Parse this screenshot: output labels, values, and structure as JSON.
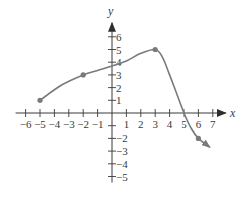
{
  "chart_data": {
    "type": "line",
    "title": "",
    "xlabel": "x",
    "ylabel": "y",
    "xlim": [
      -6,
      7
    ],
    "ylim": [
      -5,
      6
    ],
    "grid": false,
    "x_ticks": [
      -6,
      -5,
      -4,
      -3,
      -2,
      -1,
      1,
      2,
      3,
      4,
      5,
      6,
      7
    ],
    "x_tick_labels": [
      "−6",
      "−5",
      "−4",
      "−3",
      "−2",
      "−1",
      "1",
      "2",
      "3",
      "4",
      "5",
      "6",
      "7"
    ],
    "y_ticks": [
      6,
      5,
      4,
      3,
      2,
      1,
      -2,
      -3,
      -4,
      -5
    ],
    "y_tick_labels": [
      "6",
      "5",
      "4",
      "3",
      "2",
      "1",
      "−2",
      "−3",
      "−4",
      "−5"
    ],
    "series": [
      {
        "name": "f(x)",
        "curve": [
          [
            -5,
            1
          ],
          [
            -3.5,
            2.2
          ],
          [
            -2,
            3
          ],
          [
            -1,
            3.35
          ],
          [
            0,
            3.7
          ],
          [
            1,
            4.1
          ],
          [
            2,
            4.7
          ],
          [
            3,
            5
          ],
          [
            3.5,
            4.4
          ],
          [
            4,
            3
          ],
          [
            4.5,
            1.5
          ],
          [
            5,
            0
          ],
          [
            5.5,
            -1.2
          ],
          [
            6,
            -2
          ],
          [
            6.8,
            -2.7
          ]
        ],
        "marked_points": [
          [
            -5,
            1
          ],
          [
            -2,
            3
          ],
          [
            3,
            5
          ],
          [
            6,
            -2
          ]
        ],
        "end_arrow": true,
        "color": "#7a7a7a"
      }
    ],
    "x_intercept": [
      5,
      0
    ],
    "annotations": []
  },
  "colors": {
    "axis": "#3a3a3a",
    "curve": "#7a7a7a",
    "point": "#7a7a7a"
  }
}
